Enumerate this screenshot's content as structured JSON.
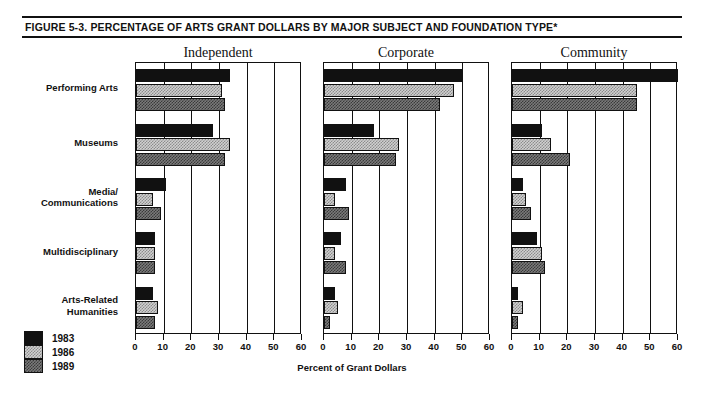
{
  "figure": {
    "title": "FIGURE 5-3.  PERCENTAGE OF ARTS GRANT DOLLARS BY MAJOR SUBJECT AND FOUNDATION TYPE*",
    "xaxis_title": "Percent of Grant Dollars"
  },
  "legend": {
    "position": "bottom-left",
    "entries": [
      {
        "label": "1983",
        "pattern": "solid-black",
        "color": "#111111"
      },
      {
        "label": "1986",
        "pattern": "light-checker",
        "color": "#d0d0d0"
      },
      {
        "label": "1989",
        "pattern": "dark-checker",
        "color": "#7a7a7a"
      }
    ]
  },
  "chart_data": {
    "type": "bar",
    "orientation": "horizontal",
    "title": "FIGURE 5-3.  PERCENTAGE OF ARTS GRANT DOLLARS BY MAJOR SUBJECT AND FOUNDATION TYPE*",
    "xlabel": "Percent of Grant Dollars",
    "ylabel": "",
    "xlim": [
      0,
      60
    ],
    "xticks": [
      0,
      10,
      20,
      30,
      40,
      50,
      60
    ],
    "xticklabels": [
      "0",
      "10",
      "20",
      "30",
      "40",
      "50",
      "60"
    ],
    "grid": true,
    "legend_position": "bottom-left",
    "categories": [
      "Performing Arts",
      "Museums",
      "Media/\n  Communications",
      "Multidisciplinary",
      "Arts-Related\n  Humanities"
    ],
    "panels": [
      {
        "name": "Independent",
        "series": [
          {
            "name": "1983",
            "values": [
              34,
              28,
              11,
              7,
              6
            ]
          },
          {
            "name": "1986",
            "values": [
              31,
              34,
              6,
              7,
              8
            ]
          },
          {
            "name": "1989",
            "values": [
              32,
              32,
              9,
              7,
              7
            ]
          }
        ]
      },
      {
        "name": "Corporate",
        "series": [
          {
            "name": "1983",
            "values": [
              50,
              18,
              8,
              6,
              4
            ]
          },
          {
            "name": "1986",
            "values": [
              47,
              27,
              4,
              4,
              5
            ]
          },
          {
            "name": "1989",
            "values": [
              42,
              26,
              9,
              8,
              2
            ]
          }
        ]
      },
      {
        "name": "Community",
        "series": [
          {
            "name": "1983",
            "values": [
              60,
              11,
              4,
              9,
              2
            ]
          },
          {
            "name": "1986",
            "values": [
              45,
              14,
              5,
              11,
              4
            ]
          },
          {
            "name": "1989",
            "values": [
              45,
              21,
              7,
              12,
              2
            ]
          }
        ]
      }
    ]
  }
}
